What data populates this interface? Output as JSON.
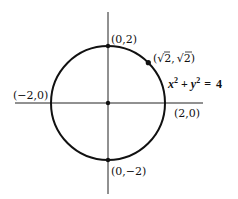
{
  "diagram": {
    "type": "circle-on-axes",
    "equation": {
      "x_term": "x",
      "plus": "+",
      "y_term": "y",
      "exp": "2",
      "equals": "=",
      "rhs": "4"
    },
    "circle": {
      "center": [
        0,
        0
      ],
      "radius": 2
    },
    "points": [
      {
        "label": "(0,2)",
        "coords": [
          0,
          2
        ]
      },
      {
        "label": "(0,−2)",
        "coords": [
          0,
          -2
        ]
      },
      {
        "label": "(−2,0)",
        "coords": [
          -2,
          0
        ]
      },
      {
        "label": "(2,0)",
        "coords": [
          2,
          0
        ]
      },
      {
        "label_open": "(",
        "sqrt1": "√2",
        "comma": ",",
        "sqrt2": "√2",
        "label_close": ")",
        "coords": [
          "sqrt2",
          "sqrt2"
        ]
      },
      {
        "label": "",
        "coords": [
          0,
          0
        ]
      }
    ],
    "colors": {
      "stroke": "#111111",
      "background": "#ffffff"
    }
  }
}
